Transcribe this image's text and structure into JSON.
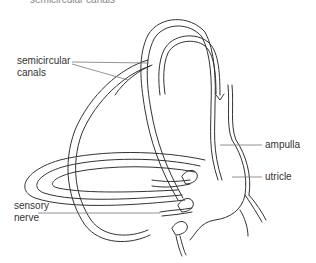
{
  "caption": "semicircular canals",
  "labels": {
    "semicircular_canals": [
      "semicircular",
      "canals"
    ],
    "sensory_nerve": [
      "sensory",
      "nerve"
    ],
    "ampulla": "ampulla",
    "utricle": "utricle"
  },
  "colors": {
    "line": "#333333",
    "leader": "#777777",
    "background": "#ffffff"
  }
}
